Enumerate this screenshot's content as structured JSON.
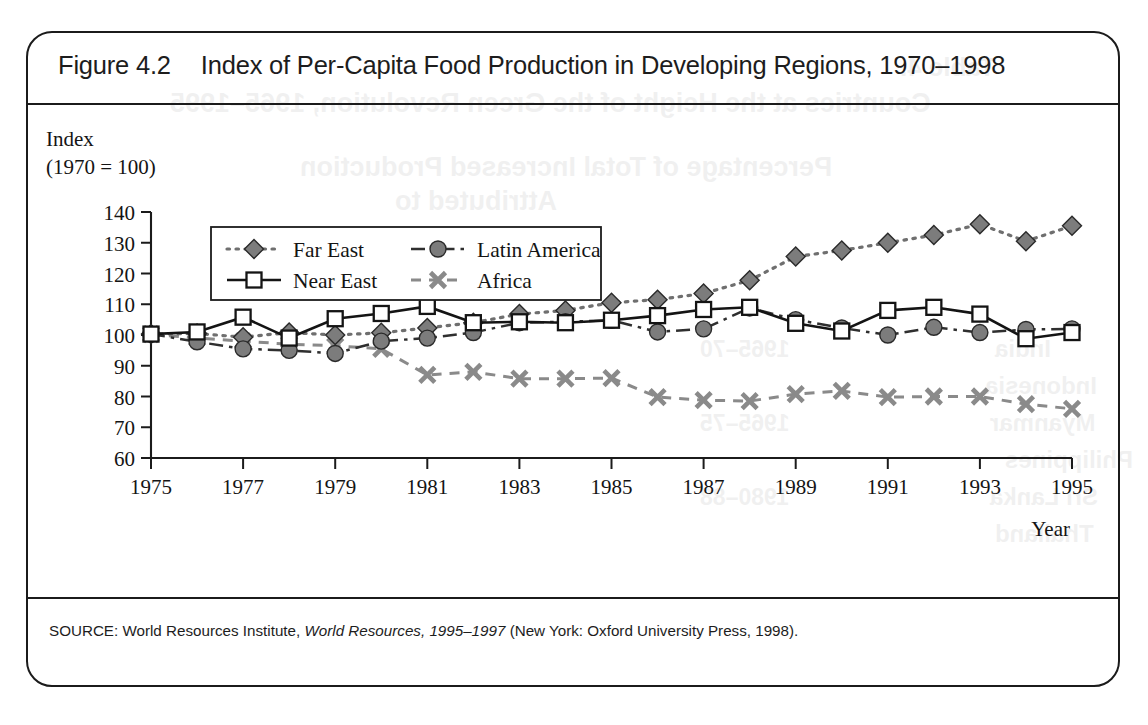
{
  "figure": {
    "number": "Figure 4.2",
    "title": "Index of Per-Capita Food Production in Developing Regions, 1970–1998",
    "source_prefix": "SOURCE: World Resources Institute, ",
    "source_italic": "World Resources, 1995–1997",
    "source_suffix": " (New York: Oxford University Press, 1998)."
  },
  "axis": {
    "y_caption_line1": "Index",
    "y_caption_line2": "(1970 = 100)",
    "x_caption": "Year"
  },
  "colors": {
    "ink": "#1b1b1b",
    "marker_gray": "#7c7c7c",
    "marker_white": "#ffffff",
    "africa_gray": "#8a8a8a",
    "page_background": "#ffffff"
  },
  "chart_data": {
    "type": "line",
    "title": "Index of Per-Capita Food Production in Developing Regions, 1970–1998",
    "xlabel": "Year",
    "ylabel": "Index (1970 = 100)",
    "xlim": [
      1975,
      1995
    ],
    "ylim": [
      60,
      140
    ],
    "x_ticks": [
      1975,
      1977,
      1979,
      1981,
      1983,
      1985,
      1987,
      1989,
      1991,
      1993,
      1995
    ],
    "y_ticks": [
      60,
      70,
      80,
      90,
      100,
      110,
      120,
      130,
      140
    ],
    "grid": false,
    "legend_position": "upper-left-inside",
    "x": [
      1975,
      1976,
      1977,
      1978,
      1979,
      1980,
      1981,
      1982,
      1983,
      1984,
      1985,
      1986,
      1987,
      1988,
      1989,
      1990,
      1991,
      1992,
      1993,
      1994,
      1995
    ],
    "series": [
      {
        "name": "Far East",
        "marker": "diamond",
        "marker_style": "gray-filled",
        "line_style": "dotted",
        "values": [
          100.3,
          100.5,
          99.3,
          100.8,
          100.0,
          100.7,
          102.3,
          104.0,
          106.8,
          108.0,
          110.5,
          111.5,
          113.5,
          117.8,
          125.5,
          127.5,
          130.0,
          132.5,
          136.0,
          130.5,
          135.5
        ]
      },
      {
        "name": "Latin America",
        "marker": "circle",
        "marker_style": "gray-filled",
        "line_style": "dash-dot",
        "values": [
          100.3,
          97.8,
          95.5,
          95.0,
          94.0,
          98.0,
          99.0,
          100.8,
          104.0,
          104.3,
          104.8,
          101.0,
          102.0,
          108.8,
          105.0,
          102.3,
          100.0,
          102.5,
          100.8,
          101.8,
          102.0
        ]
      },
      {
        "name": "Near East",
        "marker": "square",
        "marker_style": "white-filled",
        "line_style": "solid",
        "values": [
          100.3,
          101.0,
          105.8,
          99.0,
          105.3,
          107.0,
          109.3,
          104.0,
          104.3,
          104.0,
          104.8,
          106.3,
          108.3,
          109.0,
          103.8,
          101.3,
          108.0,
          109.0,
          106.8,
          98.8,
          100.8
        ]
      },
      {
        "name": "Africa",
        "marker": "x",
        "marker_style": "gray-stroke",
        "line_style": "dashed",
        "values": [
          100.3,
          99.0,
          98.0,
          97.0,
          96.5,
          95.5,
          87.0,
          88.0,
          85.8,
          85.8,
          86.0,
          79.8,
          78.8,
          78.5,
          80.8,
          81.8,
          79.8,
          80.0,
          80.0,
          77.5,
          76.0
        ]
      }
    ]
  },
  "bleed_text": {
    "items": [
      "Table 4.",
      "Countries at the Height of the Green Revolution, 1965–1995",
      "Percentage of Total Increased Production",
      "Attributed to",
      "Annualized",
      "India",
      "Indonesia",
      "Myanmar",
      "Philippines",
      "Sri Lanka",
      "Thailand",
      "1965–70",
      "1965–75",
      "1980–88",
      "1985–95"
    ]
  }
}
